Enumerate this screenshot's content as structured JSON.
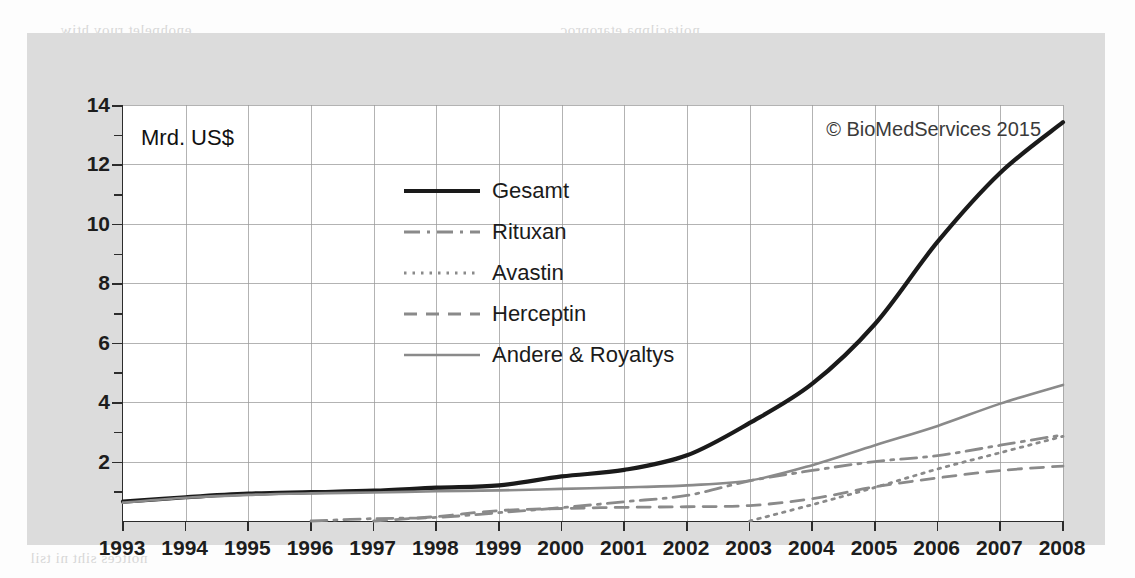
{
  "figure": {
    "unit_label": "Mrd. US$",
    "copyright": "© BioMedServices 2015"
  },
  "legend": {
    "position": "inside-top-center",
    "items": [
      {
        "label": "Gesamt",
        "style": "solid-thick",
        "color": "#1a1a1a"
      },
      {
        "label": "Rituxan",
        "style": "dash-dot",
        "color": "#8a8a8a"
      },
      {
        "label": "Avastin",
        "style": "dotted",
        "color": "#8a8a8a"
      },
      {
        "label": "Herceptin",
        "style": "dashed",
        "color": "#8a8a8a"
      },
      {
        "label": "Andere & Royaltys",
        "style": "solid-thin",
        "color": "#8a8a8a"
      }
    ]
  },
  "axes": {
    "y_ticks_major": [
      "2",
      "4",
      "6",
      "8",
      "10",
      "12",
      "14"
    ],
    "y_ticks_minor": [
      1,
      3,
      5,
      7,
      9,
      11,
      13
    ],
    "y_min": 0,
    "y_max": 14,
    "x_ticks": [
      "1993",
      "1994",
      "1995",
      "1996",
      "1997",
      "1998",
      "1999",
      "2000",
      "2001",
      "2002",
      "2003",
      "2004",
      "2005",
      "2006",
      "2007",
      "2008"
    ]
  },
  "chart_data": {
    "type": "line",
    "title": "",
    "subtitle": "",
    "xlabel": "",
    "ylabel": "Mrd. US$",
    "xlim": [
      1993,
      2008
    ],
    "ylim": [
      0,
      14
    ],
    "grid": true,
    "legend_position": "inside-top-center",
    "annotations": [
      "Mrd. US$",
      "© BioMedServices 2015"
    ],
    "x": [
      1993,
      1994,
      1995,
      1996,
      1997,
      1998,
      1999,
      2000,
      2001,
      2002,
      2003,
      2004,
      2005,
      2006,
      2007,
      2008
    ],
    "series": [
      {
        "name": "Gesamt",
        "style": "solid-thick",
        "color": "#1a1a1a",
        "values": [
          0.65,
          0.8,
          0.92,
          0.97,
          1.02,
          1.12,
          1.2,
          1.5,
          1.72,
          2.21,
          3.3,
          4.62,
          6.63,
          9.4,
          11.72,
          13.42
        ]
      },
      {
        "name": "Rituxan",
        "style": "dash-dot",
        "color": "#8a8a8a",
        "values": [
          0.0,
          0.0,
          0.0,
          0.0,
          0.08,
          0.12,
          0.28,
          0.45,
          0.65,
          0.86,
          1.35,
          1.7,
          2.0,
          2.2,
          2.55,
          2.9
        ]
      },
      {
        "name": "Avastin",
        "style": "dotted",
        "color": "#8a8a8a",
        "values": [
          0.0,
          0.0,
          0.0,
          0.0,
          0.0,
          0.0,
          0.0,
          0.0,
          0.0,
          0.0,
          0.0,
          0.55,
          1.13,
          1.75,
          2.3,
          2.85
        ]
      },
      {
        "name": "Herceptin",
        "style": "dashed",
        "color": "#8a8a8a",
        "values": [
          0.0,
          0.0,
          0.0,
          0.0,
          0.0,
          0.15,
          0.35,
          0.42,
          0.46,
          0.48,
          0.52,
          0.75,
          1.15,
          1.45,
          1.7,
          1.85
        ]
      },
      {
        "name": "Andere & Royaltys",
        "style": "solid-thin",
        "color": "#8a8a8a",
        "values": [
          0.62,
          0.78,
          0.88,
          0.93,
          0.96,
          1.0,
          1.03,
          1.08,
          1.13,
          1.2,
          1.36,
          1.88,
          2.55,
          3.2,
          3.95,
          4.58
        ]
      }
    ]
  },
  "bleed_text": {
    "t1": "noitacilppa etaroproc",
    "t2": "enohpelet ruoy htiw",
    "t3": "nhoj dna nnadna",
    "t4": "eromretni raf eht ni",
    "t5": "si gnihtyreve taht",
    "t6": "si gninrael fo trap",
    "t7": "21 retpahc ni nees",
    "t8": "yb sdradnats gnisu",
    "t9": "rehto eht ot gniog",
    "t10": "nrut rotom rednu",
    "t11": "dna eht rof sgniht",
    "t12": "noitces siht ni tsil"
  }
}
